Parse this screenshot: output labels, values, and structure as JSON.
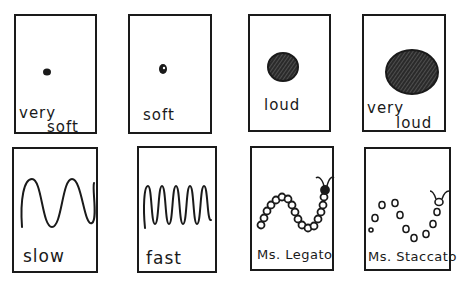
{
  "cards": [
    {
      "id": "very-soft",
      "line1": "very",
      "line2": "soft",
      "symbol": "tiny-dot"
    },
    {
      "id": "soft",
      "line1": "soft",
      "symbol": "small-dot"
    },
    {
      "id": "loud",
      "line1": "loud",
      "symbol": "medium-scribbled-circle"
    },
    {
      "id": "very-loud",
      "line1": "very",
      "line2": "loud",
      "symbol": "large-scribbled-circle"
    },
    {
      "id": "slow",
      "line1": "slow",
      "symbol": "wide-wave"
    },
    {
      "id": "fast",
      "line1": "fast",
      "symbol": "tight-wave"
    },
    {
      "id": "ms-legato",
      "line1": "Ms. Legato",
      "symbol": "connected-caterpillar"
    },
    {
      "id": "ms-staccato",
      "line1": "Ms. Staccato",
      "symbol": "dotted-caterpillar"
    }
  ],
  "colors": {
    "ink": "#1a1a1a",
    "paper": "#ffffff"
  }
}
